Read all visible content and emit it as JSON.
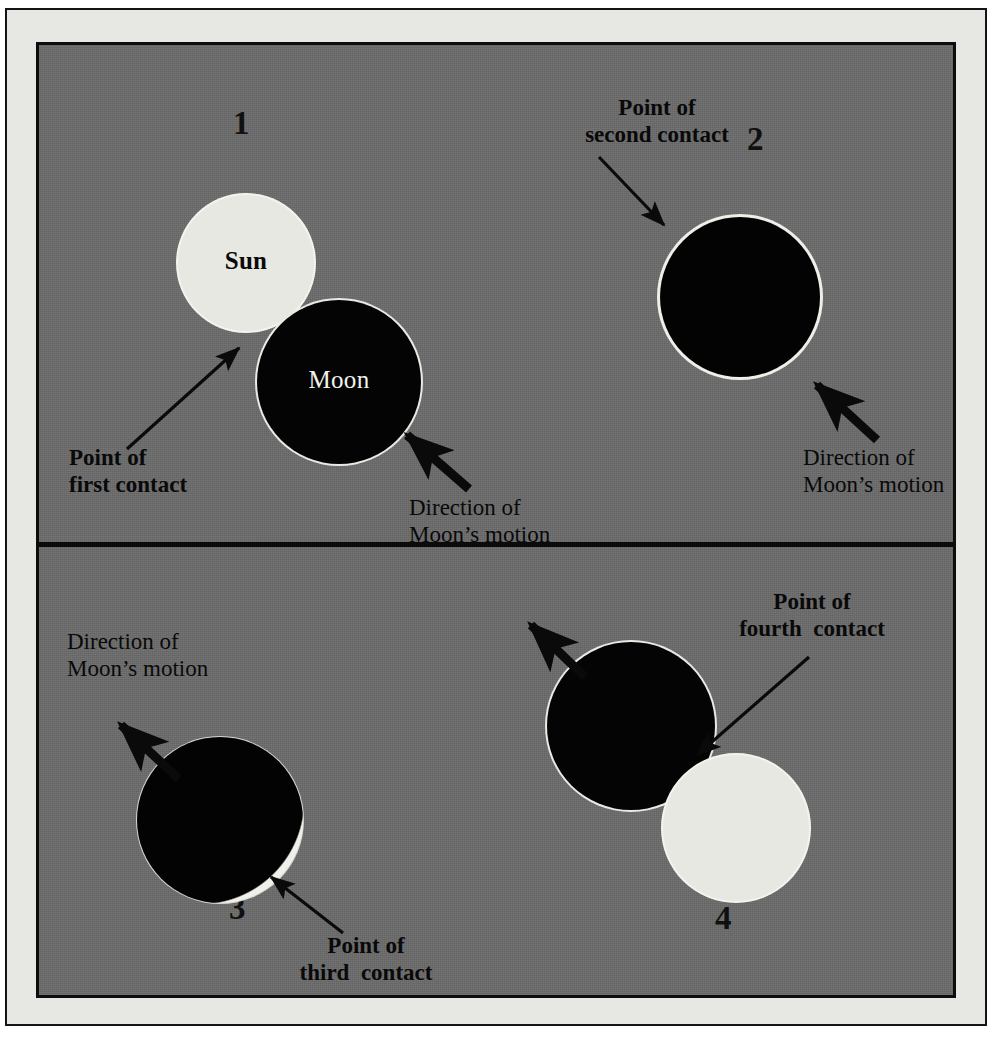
{
  "figure": {
    "background_color": "#6b6b6b",
    "margin_color": "#e7e7e3",
    "frame_color": "#0d0d0d",
    "sun_color": "#e8e8e2",
    "moon_color": "#040404",
    "moon_rim_color": "#eaeae4",
    "text_color": "#090909"
  },
  "panels": [
    {
      "number": "1",
      "bodies": [
        {
          "name": "Sun",
          "label": "Sun"
        },
        {
          "name": "Moon",
          "label": "Moon"
        }
      ],
      "annotations": [
        {
          "name": "point-of-first-contact",
          "line1": "Point of",
          "line2": "first contact"
        },
        {
          "name": "direction-of-moons-motion",
          "line1": "Direction of",
          "line2": "Moon’s motion"
        }
      ]
    },
    {
      "number": "2",
      "bodies": [
        {
          "name": "Moon",
          "label": ""
        }
      ],
      "annotations": [
        {
          "name": "point-of-second-contact",
          "line1": "Point of",
          "line2": "second contact"
        },
        {
          "name": "direction-of-moons-motion",
          "line1": "Direction of",
          "line2": "Moon’s motion"
        }
      ]
    },
    {
      "number": "3",
      "bodies": [
        {
          "name": "Moon",
          "label": ""
        }
      ],
      "annotations": [
        {
          "name": "direction-of-moons-motion",
          "line1": "Direction of",
          "line2": "Moon’s motion"
        },
        {
          "name": "point-of-third-contact",
          "line1": "Point of",
          "line2": "third  contact"
        }
      ]
    },
    {
      "number": "4",
      "bodies": [
        {
          "name": "Moon",
          "label": ""
        },
        {
          "name": "Sun",
          "label": ""
        }
      ],
      "annotations": [
        {
          "name": "point-of-fourth-contact",
          "line1": "Point of",
          "line2": "fourth  contact"
        }
      ]
    }
  ],
  "labels": {
    "p1_number": "1",
    "p2_number": "2",
    "p3_number": "3",
    "p4_number": "4",
    "sun": "Sun",
    "moon": "Moon",
    "first_contact_l1": "Point of",
    "first_contact_l2": "first contact",
    "second_contact_l1": "Point of",
    "second_contact_l2": "second contact",
    "third_contact_l1": "Point of",
    "third_contact_l2": "third  contact",
    "fourth_contact_l1": "Point of",
    "fourth_contact_l2": "fourth  contact",
    "motion_l1": "Direction of",
    "motion_l2": "Moon’s motion"
  }
}
